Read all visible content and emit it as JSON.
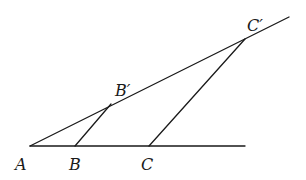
{
  "diagram": {
    "stroke_color": "#1a1a1a",
    "background": "#ffffff",
    "points": {
      "A": {
        "label": "A",
        "x": 30,
        "y": 146
      },
      "B": {
        "label": "B",
        "x": 75,
        "y": 146
      },
      "C": {
        "label": "C",
        "x": 149,
        "y": 146
      },
      "Bp": {
        "label": "B′",
        "x": 111,
        "y": 105
      },
      "Cp": {
        "label": "C′",
        "x": 245,
        "y": 39
      }
    },
    "segments": [
      {
        "name": "base-line",
        "from": [
          30,
          146
        ],
        "to": [
          245,
          146
        ]
      },
      {
        "name": "slanted-line",
        "from": [
          30,
          146
        ],
        "to": [
          289,
          17
        ]
      },
      {
        "name": "segment-BBp",
        "from": [
          75,
          146
        ],
        "to": [
          111,
          105
        ]
      },
      {
        "name": "segment-CCp",
        "from": [
          149,
          146
        ],
        "to": [
          245,
          39
        ]
      }
    ]
  }
}
